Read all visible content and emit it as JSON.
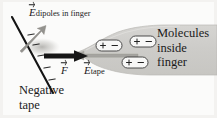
{
  "figure": {
    "background_color": "#f2f1ef",
    "paper_color": "#fbfbfa",
    "ink_color": "#1a1a1a",
    "finger_fill": "#cfcecb",
    "finger_edge": "#b6b5b1",
    "arrow_gray": "#9a9a96"
  },
  "labels": {
    "e_dipoles": {
      "symbol": "E",
      "subscript": "dipoles in finger",
      "vector": true
    },
    "force": {
      "symbol": "F",
      "subscript": "",
      "vector": true
    },
    "e_tape": {
      "symbol": "E",
      "subscript": "tape",
      "vector": true
    },
    "molecules": {
      "line1": "Molecules",
      "line2": "inside",
      "line3": "finger"
    },
    "negative_tape": {
      "line1": "Negative",
      "line2": "tape"
    }
  },
  "tape": {
    "name": "negative-tape",
    "charge_sign": "−",
    "charge_count": 5,
    "orientation": "diagonal",
    "from": [
      12,
      17
    ],
    "to": [
      53,
      93
    ]
  },
  "dipoles": {
    "positive_sign": "+",
    "negative_sign": "−",
    "count": 3,
    "items": [
      {
        "id": "dipole-1",
        "x": 96,
        "y": 40,
        "w": 26,
        "h": 11
      },
      {
        "id": "dipole-2",
        "x": 130,
        "y": 36,
        "w": 26,
        "h": 11
      },
      {
        "id": "dipole-3",
        "x": 122,
        "y": 57,
        "w": 26,
        "h": 11
      }
    ]
  },
  "arrows": {
    "e_dipoles_arrow": {
      "name": "e-dipoles-arrow",
      "direction": "up-right",
      "color": "#8f8f8b"
    },
    "force_arrow": {
      "name": "force-arrow",
      "direction": "right",
      "color": "#161616"
    },
    "e_tape_arrow": {
      "name": "e-tape-arrow",
      "direction": "left",
      "color": "#a3a29e"
    }
  }
}
